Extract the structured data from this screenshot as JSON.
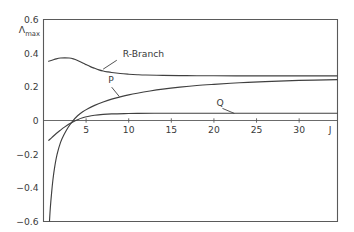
{
  "chart_data": {
    "type": "line",
    "title": "",
    "subtitle": "",
    "xlabel": "J",
    "ylabel": "Λmax",
    "ylabel_base": "Λ",
    "ylabel_subscript": "max",
    "xlim": [
      0,
      34.5
    ],
    "ylim": [
      -0.6,
      0.6
    ],
    "grid": false,
    "legend_position": "inline-annotations",
    "x_ticks": [
      5,
      10,
      15,
      20,
      25,
      30
    ],
    "x_tick_labels": [
      "5",
      "10",
      "15",
      "20",
      "25",
      "30"
    ],
    "y_ticks": [
      0.6,
      0.4,
      0.2,
      0,
      -0.2,
      -0.4,
      -0.6
    ],
    "y_tick_labels": [
      "0.6",
      "0.4",
      "0.2",
      "0",
      "−0.2",
      "−0.4",
      "−0.6"
    ],
    "zero_line": 0,
    "curve_color": "#404040",
    "axis_color": "#5a5a5a",
    "background_color": "#ffffff",
    "annotations": [
      {
        "id": "r-branch",
        "label": "R-Branch",
        "label_x": 9.3,
        "label_y": 0.375,
        "leader_from_x": 8.6,
        "leader_from_y": 0.358,
        "leader_to_x": 7.0,
        "leader_to_y": 0.305
      },
      {
        "id": "p-branch",
        "label": "P",
        "label_x": 7.6,
        "label_y": 0.225,
        "leader_from_x": 8.0,
        "leader_from_y": 0.198,
        "leader_to_x": 8.9,
        "leader_to_y": 0.142
      },
      {
        "id": "q-branch",
        "label": "Q",
        "label_x": 20.3,
        "label_y": 0.087,
        "leader_from_x": 21.0,
        "leader_from_y": 0.072,
        "leader_to_x": 22.4,
        "leader_to_y": 0.042
      }
    ],
    "series": [
      {
        "name": "R-Branch",
        "asymptote": 0.265,
        "peak_value": 0.372,
        "peak_x": 3.1,
        "start_value": 0.352,
        "x": [
          0.6,
          1.0,
          1.5,
          2.0,
          2.5,
          3.0,
          3.5,
          4.0,
          4.5,
          5.0,
          5.5,
          6.0,
          6.5,
          7.0,
          7.5,
          8.0,
          9.0,
          10.0,
          11.0,
          12.0,
          14.0,
          16.0,
          18.0,
          20.0,
          24.0,
          28.0,
          32.0,
          34.5
        ],
        "values": [
          0.352,
          0.358,
          0.366,
          0.371,
          0.372,
          0.371,
          0.366,
          0.357,
          0.345,
          0.332,
          0.32,
          0.31,
          0.301,
          0.294,
          0.289,
          0.285,
          0.279,
          0.275,
          0.272,
          0.27,
          0.268,
          0.267,
          0.266,
          0.266,
          0.265,
          0.265,
          0.265,
          0.265
        ]
      },
      {
        "name": "P",
        "asymptote": 0.243,
        "x": [
          0.62,
          0.7,
          0.8,
          0.95,
          1.1,
          1.3,
          1.6,
          2.0,
          2.4,
          2.9,
          3.4,
          4.0,
          4.6,
          5.2,
          6.0,
          7.0,
          8.0,
          9.0,
          10.0,
          11.0,
          12.5,
          14.0,
          16.0,
          18.0,
          20.0,
          23.0,
          26.0,
          30.0,
          34.5
        ],
        "values": [
          -0.665,
          -0.6,
          -0.52,
          -0.43,
          -0.355,
          -0.28,
          -0.2,
          -0.13,
          -0.085,
          -0.04,
          -0.005,
          0.028,
          0.052,
          0.07,
          0.09,
          0.11,
          0.127,
          0.14,
          0.152,
          0.162,
          0.175,
          0.186,
          0.198,
          0.208,
          0.215,
          0.224,
          0.231,
          0.238,
          0.243
        ]
      },
      {
        "name": "Q",
        "asymptote": 0.043,
        "x": [
          0.62,
          1.0,
          1.5,
          2.0,
          2.5,
          3.0,
          3.5,
          4.0,
          4.6,
          5.2,
          6.0,
          7.0,
          8.0,
          9.5,
          11.0,
          13.0,
          16.0,
          20.0,
          25.0,
          30.0,
          34.5
        ],
        "values": [
          -0.118,
          -0.1,
          -0.077,
          -0.057,
          -0.038,
          -0.021,
          -0.007,
          0.005,
          0.016,
          0.024,
          0.031,
          0.036,
          0.039,
          0.041,
          0.042,
          0.043,
          0.043,
          0.043,
          0.043,
          0.043,
          0.043
        ]
      }
    ]
  }
}
